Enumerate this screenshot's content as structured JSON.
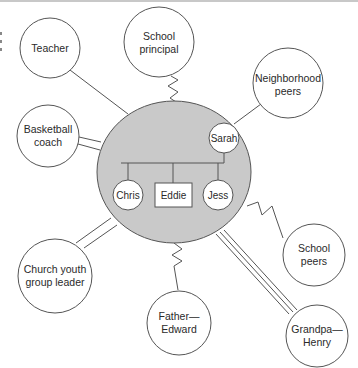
{
  "diagram": {
    "type": "ecomap",
    "colors": {
      "hub_fill": "#c9c9c9",
      "stroke": "#555555",
      "node_fill": "#ffffff",
      "text": "#2a2a2a"
    },
    "hub": {
      "members": [
        {
          "name": "Sarah",
          "shape": "circle",
          "role": "parent"
        },
        {
          "name": "Chris",
          "shape": "circle",
          "role": "child"
        },
        {
          "name": "Eddie",
          "shape": "square",
          "role": "child"
        },
        {
          "name": "Jess",
          "shape": "circle",
          "role": "child"
        }
      ]
    },
    "nodes": [
      {
        "id": "teacher",
        "lines": [
          "Teacher"
        ],
        "connection": "normal"
      },
      {
        "id": "school-principal",
        "lines": [
          "School",
          "principal"
        ],
        "connection": "stressful"
      },
      {
        "id": "neighborhood-peers",
        "lines": [
          "Neighborhood",
          "peers"
        ],
        "connection": "normal"
      },
      {
        "id": "basketball-coach",
        "lines": [
          "Basketball",
          "coach"
        ],
        "connection": "strong"
      },
      {
        "id": "school-peers",
        "lines": [
          "School",
          "peers"
        ],
        "connection": "stressful"
      },
      {
        "id": "church-youth-group-leader",
        "lines": [
          "Church youth",
          "group leader"
        ],
        "connection": "strong"
      },
      {
        "id": "father-edward",
        "lines": [
          "Father—",
          "Edward"
        ],
        "connection": "stressful"
      },
      {
        "id": "grandpa-henry",
        "lines": [
          "Grandpa—",
          "Henry"
        ],
        "connection": "very-strong"
      }
    ],
    "legend_connection_types": {
      "normal": "single line",
      "strong": "double line",
      "very-strong": "triple line",
      "stressful": "zigzag line"
    }
  }
}
